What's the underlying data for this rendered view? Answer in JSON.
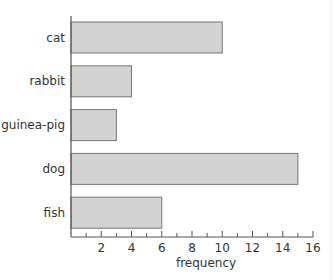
{
  "chart_data": {
    "type": "bar",
    "orientation": "horizontal",
    "title": "",
    "categories": [
      "cat",
      "rabbit",
      "guinea-pig",
      "dog",
      "fish"
    ],
    "values": [
      10,
      4,
      3,
      15,
      6
    ],
    "xlabel": "frequency",
    "ylabel": "",
    "xlim": [
      0,
      16
    ],
    "x_major_ticks": [
      2,
      4,
      6,
      8,
      10,
      12,
      14,
      16
    ],
    "x_minor_tick_step": 1,
    "grid": false,
    "legend": null,
    "colors": {
      "bar_fill": "#d3d3d3",
      "bar_stroke": "#777777",
      "axis": "#555555",
      "text": "#333333"
    }
  }
}
